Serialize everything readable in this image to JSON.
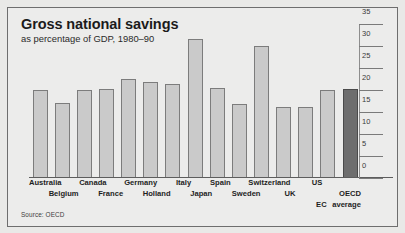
{
  "chart_data": {
    "type": "bar",
    "title": "Gross national savings",
    "subtitle": "as percentage of GDP, 1980–90",
    "source": "Source: OECD",
    "xlabel": "",
    "ylabel": "",
    "ylim": [
      0,
      35
    ],
    "yticks": [
      0,
      5,
      10,
      15,
      20,
      25,
      30,
      35
    ],
    "ytick_labels": [
      "0",
      "5",
      "10",
      "15",
      "20",
      "25",
      "30",
      "35"
    ],
    "grid": false,
    "legend": "none",
    "categories": [
      "Australia",
      "Belgium",
      "Canada",
      "France",
      "Germany",
      "Holland",
      "Italy",
      "Japan",
      "Spain",
      "Sweden",
      "Switzerland",
      "UK",
      "US",
      "EC average",
      "OECD average"
    ],
    "values": [
      20.0,
      17.0,
      20.0,
      20.1,
      22.5,
      21.8,
      21.3,
      31.5,
      20.3,
      16.8,
      30.0,
      16.0,
      16.0,
      20.0,
      20.2
    ],
    "highlight_index": 14,
    "label_rows": [
      0,
      1,
      0,
      1,
      0,
      1,
      0,
      1,
      0,
      1,
      0,
      1,
      0,
      2,
      1
    ],
    "label_lines": [
      [
        "Australia"
      ],
      [
        "Belgium"
      ],
      [
        "Canada"
      ],
      [
        "France"
      ],
      [
        "Germany"
      ],
      [
        "Holland"
      ],
      [
        "Italy"
      ],
      [
        "Japan"
      ],
      [
        "Spain"
      ],
      [
        "Sweden"
      ],
      [
        "Switzerland"
      ],
      [
        "UK"
      ],
      [
        "US"
      ],
      [
        "EC",
        "average"
      ],
      [
        "OECD",
        "average"
      ]
    ]
  },
  "colors": {
    "bar_fill": "#cacaca",
    "bar_stroke": "#7c7c7c",
    "highlight_fill": "#6e6e6e",
    "background": "#ececeb",
    "frame_border": "#6e6e6e",
    "text": "#1b1b1b"
  }
}
